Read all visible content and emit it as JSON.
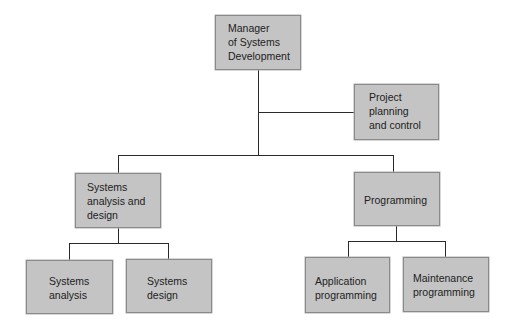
{
  "diagram": {
    "type": "org-chart",
    "nodes": {
      "manager": {
        "label": "Manager\nof Systems\nDevelopment"
      },
      "project_planning": {
        "label": "Project\nplanning\nand control"
      },
      "sad": {
        "label": "Systems\nanalysis and\ndesign"
      },
      "programming": {
        "label": "Programming"
      },
      "systems_analysis": {
        "label": "Systems\nanalysis"
      },
      "systems_design": {
        "label": "Systems\ndesign"
      },
      "application_programming": {
        "label": "Application\nprogramming"
      },
      "maintenance_programming": {
        "label": "Maintenance\nprogramming"
      }
    },
    "edges": [
      [
        "manager",
        "project_planning"
      ],
      [
        "manager",
        "sad"
      ],
      [
        "manager",
        "programming"
      ],
      [
        "sad",
        "systems_analysis"
      ],
      [
        "sad",
        "systems_design"
      ],
      [
        "programming",
        "application_programming"
      ],
      [
        "programming",
        "maintenance_programming"
      ]
    ],
    "colors": {
      "box_fill": "#c4c4c4",
      "box_border": "#8a8a8a",
      "line": "#2a2a2a"
    }
  }
}
